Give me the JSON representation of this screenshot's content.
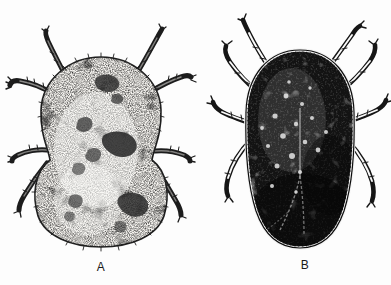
{
  "plate": {
    "background_color": "#fdfdfd",
    "ink_color": "#111111",
    "style": "stippled scientific line illustration, scanned halftone"
  },
  "figures": [
    {
      "label": "A",
      "data_name": "figure-a-pale-mite",
      "description": "Pale engorged mite, dorsal view, stipple shading, eight legs",
      "body_fill": "#f2f0ec",
      "body_outline": "#262626",
      "texture": "fine stipple with darker mottled patches",
      "leg_count": 8,
      "center_x": 101,
      "center_y": 148,
      "body_width": 120,
      "body_height": 182
    },
    {
      "label": "B",
      "data_name": "figure-b-dark-mite",
      "description": "Dark sclerotized mite, dorsal view, pitted surface with fringed margin, eight legs",
      "body_fill": "#141414",
      "body_outline": "#0a0a0a",
      "texture": "dense dark ground with pale pits and beaded marginal fringe",
      "leg_count": 8,
      "center_x": 300,
      "center_y": 148,
      "body_width": 108,
      "body_height": 196
    }
  ],
  "captions": {
    "a": "A",
    "b": "B"
  }
}
